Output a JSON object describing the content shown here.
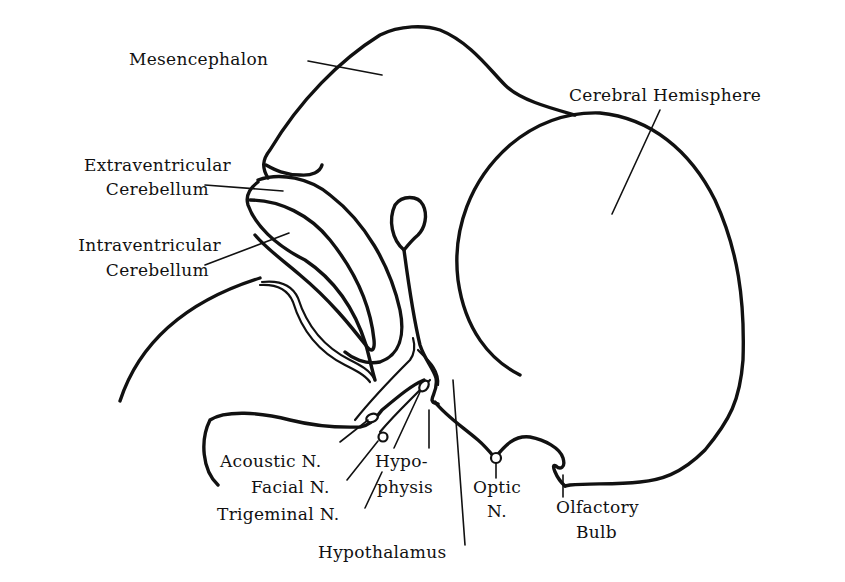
{
  "diagram": {
    "title": "",
    "labels": {
      "mesencephalon": "Mesencephalon",
      "cerebral_hemisphere": "Cerebral Hemisphere",
      "extraventricular_cerebellum": [
        "Extraventricular",
        "Cerebellum"
      ],
      "intraventricular_cerebellum": [
        "Intraventricular",
        "Cerebellum"
      ],
      "acoustic_n": "Acoustic N.",
      "facial_n": "Facial N.",
      "trigeminal_n": "Trigeminal N.",
      "hypophysis": [
        "Hypo-",
        "physis"
      ],
      "hypothalamus": "Hypothalamus",
      "optic_n": [
        "Optic",
        "N."
      ],
      "olfactory_bulb": [
        "Olfactory",
        "Bulb"
      ]
    },
    "colors": {
      "stroke": "#111111",
      "background": "#ffffff"
    }
  }
}
